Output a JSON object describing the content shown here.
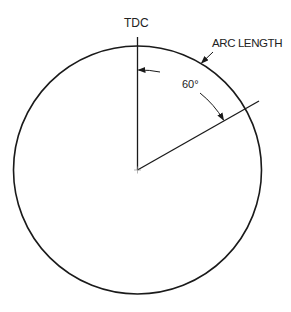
{
  "diagram": {
    "labels": {
      "tdc": "TDC",
      "arc_length": "ARC LENGTH",
      "angle": "60°"
    },
    "geometry": {
      "center": [
        137.5,
        170
      ],
      "radius": 124,
      "angle_deg": 60
    },
    "colors": {
      "stroke": "#1a1a1a",
      "background": "#ffffff"
    }
  }
}
